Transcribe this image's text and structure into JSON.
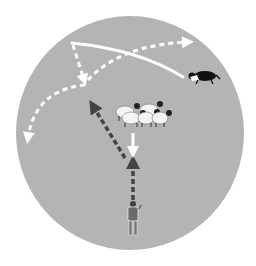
{
  "diagram": {
    "title": "",
    "colors": {
      "background": "#ffffff",
      "field": "#b4b4b4",
      "white_path": "#ffffff",
      "dark_path": "#444444",
      "sheep_body": "#f4f4f4",
      "sheep_head": "#222222",
      "dog_black": "#111111",
      "dog_white": "#ffffff",
      "handler": "#6a6a6a"
    },
    "elements": [
      {
        "id": "field",
        "kind": "field-circle"
      },
      {
        "id": "handler",
        "kind": "person",
        "label": "handler"
      },
      {
        "id": "flock",
        "kind": "sheep",
        "count": 5
      },
      {
        "id": "dog",
        "kind": "dog",
        "label": "border collie"
      },
      {
        "id": "outrun-solid",
        "kind": "path",
        "style": "solid-white"
      },
      {
        "id": "outrun-right",
        "kind": "path",
        "style": "dashed-white",
        "arrow": "end"
      },
      {
        "id": "outrun-left",
        "kind": "path",
        "style": "dashed-white",
        "arrow": "end"
      },
      {
        "id": "lift-down",
        "kind": "path",
        "style": "dashed-white",
        "arrow": "end"
      },
      {
        "id": "fetch-down",
        "kind": "path",
        "style": "solid-white",
        "arrow": "end"
      },
      {
        "id": "drive-up",
        "kind": "path",
        "style": "dashed-dark",
        "arrow": "end"
      },
      {
        "id": "drive-diagonal",
        "kind": "path",
        "style": "dashed-dark",
        "arrow": "end"
      }
    ]
  }
}
